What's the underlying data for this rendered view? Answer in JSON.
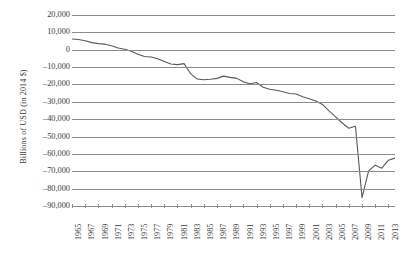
{
  "chart_data": {
    "type": "line",
    "title": "",
    "xlabel": "",
    "ylabel": "Billions of USD (in 2014 $)",
    "ylim": [
      -90000,
      20000
    ],
    "ytick_step": 10000,
    "ytick_labels": [
      "20,000",
      "10,000",
      "0",
      "–10,000",
      "–20,000",
      "–30,000",
      "–40,000",
      "–50,000",
      "–60,000",
      "–70,000",
      "–80,000",
      "–90,000"
    ],
    "ytick_values": [
      20000,
      10000,
      0,
      -10000,
      -20000,
      -30000,
      -40000,
      -50000,
      -60000,
      -70000,
      -80000,
      -90000
    ],
    "xtick_labels": [
      "1965",
      "1967",
      "1969",
      "1971",
      "1973",
      "1975",
      "1977",
      "1979",
      "1981",
      "1983",
      "1985",
      "1987",
      "1989",
      "1991",
      "1993",
      "1995",
      "1997",
      "1999",
      "2001",
      "2003",
      "2005",
      "2007",
      "2009",
      "2011",
      "2013"
    ],
    "xlim": [
      1965,
      2014
    ],
    "grid": true,
    "legend": "none",
    "line_color": "#595959",
    "grid_color": "#8c8c8c",
    "x": [
      1965,
      1966,
      1967,
      1968,
      1969,
      1970,
      1971,
      1972,
      1973,
      1974,
      1975,
      1976,
      1977,
      1978,
      1979,
      1980,
      1981,
      1982,
      1983,
      1984,
      1985,
      1986,
      1987,
      1988,
      1989,
      1990,
      1991,
      1992,
      1993,
      1994,
      1995,
      1996,
      1997,
      1998,
      1999,
      2000,
      2001,
      2002,
      2003,
      2004,
      2005,
      2006,
      2007,
      2008,
      2009,
      2010,
      2011,
      2012,
      2013,
      2014
    ],
    "values": [
      6200,
      5900,
      5200,
      4100,
      3500,
      3200,
      2300,
      1000,
      300,
      -900,
      -2600,
      -3900,
      -4200,
      -5200,
      -6800,
      -8200,
      -8600,
      -8000,
      -13800,
      -16900,
      -17300,
      -17000,
      -16500,
      -15200,
      -15900,
      -16500,
      -18500,
      -19600,
      -18900,
      -21600,
      -22800,
      -23300,
      -24200,
      -25200,
      -25500,
      -27100,
      -28200,
      -29500,
      -31500,
      -35200,
      -38700,
      -42200,
      -45200,
      -44100,
      -85200,
      -69800,
      -66500,
      -68200,
      -63600,
      -62400
    ]
  }
}
